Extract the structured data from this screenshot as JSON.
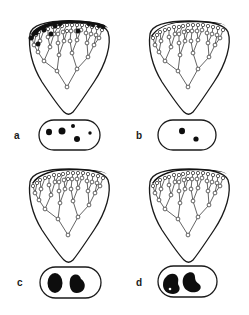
{
  "figure": {
    "panels": [
      {
        "id": "a",
        "label": "a",
        "filled_leaf_nodes": true,
        "inclusions": "five small black dots of varying size"
      },
      {
        "id": "b",
        "label": "b",
        "filled_leaf_nodes": false,
        "inclusions": "two small black dots"
      },
      {
        "id": "c",
        "label": "c",
        "filled_leaf_nodes": false,
        "inclusions": "two large black blobs"
      },
      {
        "id": "d",
        "label": "d",
        "filled_leaf_nodes": false,
        "inclusions": "two large kidney-shaped black blobs, left one with a small white hole"
      }
    ]
  },
  "colors": {
    "ink": "#1a1a1a",
    "background": "#ffffff"
  }
}
